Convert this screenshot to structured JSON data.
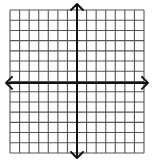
{
  "diagram": {
    "type": "coordinate-plane",
    "grid": {
      "columns": 14,
      "rows": 14,
      "left": 10,
      "top": 10,
      "right": 144,
      "bottom": 153,
      "line_color": "#555555",
      "background": "#ffffff"
    },
    "axes": {
      "x_axis": {
        "y": 82.9,
        "x_start": 6,
        "x_end": 148,
        "arrows": "both"
      },
      "y_axis": {
        "x": 77,
        "y_start": 4,
        "y_end": 158,
        "arrows": "both"
      },
      "color": "#111111"
    }
  }
}
